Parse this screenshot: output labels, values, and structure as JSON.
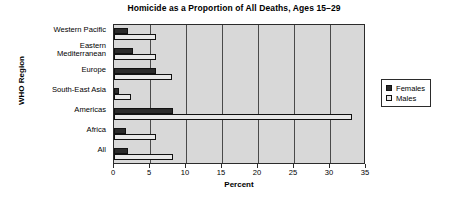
{
  "chart_data": {
    "type": "bar",
    "orientation": "horizontal",
    "title": "Homicide as a Proportion of All Deaths, Ages 15–29",
    "xlabel": "Percent",
    "ylabel": "WHO Region",
    "categories": [
      "Western Pacific",
      "Eastern Mediterranean",
      "Europe",
      "South-East Asia",
      "Americas",
      "Africa",
      "All"
    ],
    "category_lines": [
      [
        "Western Pacific"
      ],
      [
        "Eastern",
        "Mediterranean"
      ],
      [
        "Europe"
      ],
      [
        "South-East Asia"
      ],
      [
        "Americas"
      ],
      [
        "Africa"
      ],
      [
        "All"
      ]
    ],
    "series": [
      {
        "name": "Females",
        "color": "#2a2a2a",
        "values": [
          1.9,
          2.7,
          5.9,
          0.7,
          8.2,
          1.7,
          2.0
        ]
      },
      {
        "name": "Males",
        "color": "#e8e8e8",
        "values": [
          5.8,
          5.8,
          8.0,
          2.3,
          33.0,
          5.8,
          8.2
        ]
      }
    ],
    "xlim": [
      0,
      35
    ],
    "xticks": [
      0,
      5,
      10,
      15,
      20,
      25,
      30,
      35
    ],
    "grid": "vertical",
    "legend_position": "right",
    "plot_background": "#d8d8d8"
  }
}
